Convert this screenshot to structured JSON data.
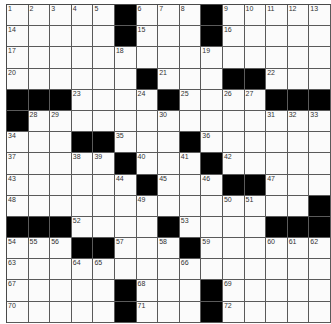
{
  "puzzle": {
    "rows": 15,
    "cols": 15,
    "colors": {
      "block": "#000000",
      "cell": "#fbfbfb",
      "line": "#5a5a5a",
      "number": "#333333"
    },
    "grid": [
      [
        1,
        2,
        3,
        4,
        5,
        "#",
        6,
        7,
        8,
        "#",
        9,
        10,
        11,
        12,
        13
      ],
      [
        14,
        0,
        0,
        0,
        0,
        "#",
        15,
        0,
        0,
        "#",
        16,
        0,
        0,
        0,
        0
      ],
      [
        17,
        0,
        0,
        0,
        0,
        18,
        0,
        0,
        0,
        19,
        0,
        0,
        0,
        0,
        0
      ],
      [
        20,
        0,
        0,
        0,
        0,
        0,
        "#",
        21,
        0,
        0,
        "#",
        "#",
        22,
        0,
        0
      ],
      [
        "#",
        "#",
        "#",
        23,
        0,
        0,
        24,
        "#",
        25,
        0,
        26,
        27,
        "#",
        "#",
        "#"
      ],
      [
        "#",
        28,
        29,
        0,
        0,
        0,
        0,
        30,
        0,
        0,
        0,
        0,
        31,
        32,
        33
      ],
      [
        34,
        0,
        0,
        "#",
        "#",
        35,
        0,
        0,
        "#",
        36,
        0,
        0,
        0,
        0,
        0
      ],
      [
        37,
        0,
        0,
        38,
        39,
        "#",
        40,
        0,
        41,
        "#",
        42,
        0,
        0,
        0,
        0
      ],
      [
        43,
        0,
        0,
        0,
        0,
        44,
        "#",
        45,
        0,
        46,
        "#",
        "#",
        47,
        0,
        0
      ],
      [
        48,
        0,
        0,
        0,
        0,
        0,
        49,
        0,
        0,
        0,
        50,
        51,
        0,
        0,
        "#"
      ],
      [
        "#",
        "#",
        "#",
        52,
        0,
        0,
        0,
        "#",
        53,
        0,
        0,
        0,
        "#",
        "#",
        "#"
      ],
      [
        54,
        55,
        56,
        "#",
        "#",
        57,
        0,
        58,
        "#",
        59,
        0,
        0,
        60,
        61,
        62
      ],
      [
        63,
        0,
        0,
        64,
        65,
        0,
        0,
        0,
        66,
        0,
        0,
        0,
        0,
        0,
        0
      ],
      [
        67,
        0,
        0,
        0,
        0,
        "#",
        68,
        0,
        0,
        "#",
        69,
        0,
        0,
        0,
        0
      ],
      [
        70,
        0,
        0,
        0,
        0,
        "#",
        71,
        0,
        0,
        "#",
        72,
        0,
        0,
        0,
        0
      ]
    ]
  }
}
